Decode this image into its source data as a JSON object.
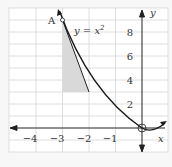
{
  "figure": {
    "curve_label": "y = x²",
    "curve_label_base": "y = x",
    "curve_label_exp": "2",
    "point_label": "A",
    "x_axis_label": "x",
    "y_axis_label": "y",
    "x_ticks": [
      "−4",
      "−3",
      "−2",
      "−1"
    ],
    "y_ticks": [
      "2",
      "4",
      "6",
      "8"
    ],
    "colors": {
      "curve": "#222222",
      "grid": "#d0d0d0",
      "shade": "#d9d9d9",
      "background": "#ffffff"
    }
  }
}
